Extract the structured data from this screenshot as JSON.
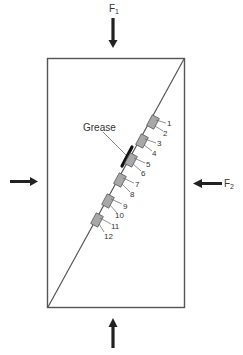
{
  "diagram": {
    "type": "biaxial-loading-specimen",
    "labels": {
      "force_top": "F",
      "force_top_sub": "1",
      "force_right": "F",
      "force_right_sub": "2",
      "grease": "Grease"
    },
    "gauges": [
      {
        "id": "1",
        "label": "1"
      },
      {
        "id": "2",
        "label": "2"
      },
      {
        "id": "3",
        "label": "3"
      },
      {
        "id": "4",
        "label": "4"
      },
      {
        "id": "5",
        "label": "5"
      },
      {
        "id": "6",
        "label": "6"
      },
      {
        "id": "7",
        "label": "7"
      },
      {
        "id": "8",
        "label": "8"
      },
      {
        "id": "9",
        "label": "9"
      },
      {
        "id": "10",
        "label": "10"
      },
      {
        "id": "11",
        "label": "11"
      },
      {
        "id": "12",
        "label": "12"
      }
    ],
    "colors": {
      "line": "#555555",
      "arrow": "#222222",
      "gauge_fill": "#a8a8a8",
      "gauge_stroke": "#555555",
      "grease": "#111111",
      "text": "#333333"
    }
  }
}
